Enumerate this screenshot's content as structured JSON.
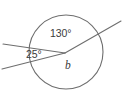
{
  "figure": {
    "kind": "geometry-diagram",
    "background_color": "#ffffff",
    "stroke_color": "#6e6e6e",
    "text_color": "#3a3a3a",
    "circle": {
      "center_x": 66,
      "center_y": 52,
      "radius": 37
    },
    "vertex": {
      "x": 65,
      "y": 53
    },
    "rays": [
      {
        "name": "ray-upper-left",
        "x1": 65,
        "y1": 53,
        "x2": 3,
        "y2": 44
      },
      {
        "name": "ray-lower-left",
        "x1": 65,
        "y1": 53,
        "x2": 2,
        "y2": 69
      },
      {
        "name": "ray-upper-right",
        "x1": 65,
        "y1": 53,
        "x2": 121,
        "y2": 21
      }
    ],
    "labels": {
      "angle_top": "130°",
      "angle_left": "25°",
      "angle_unknown": "b"
    }
  }
}
